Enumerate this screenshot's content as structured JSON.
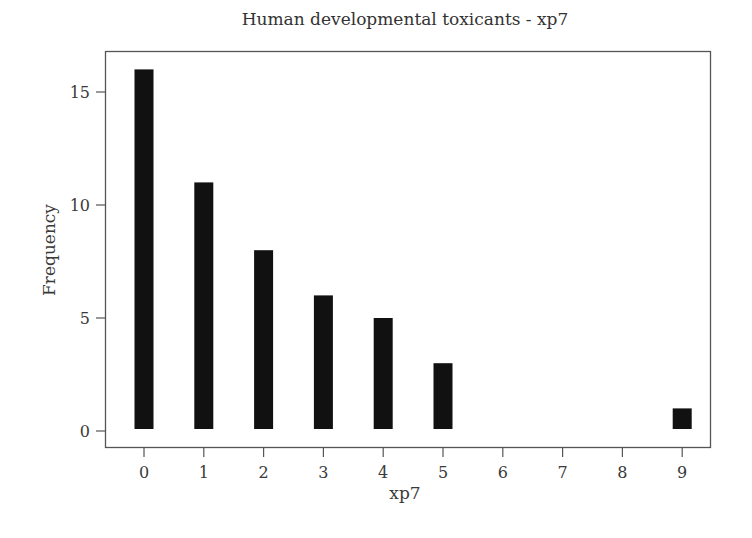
{
  "chart_data": {
    "type": "bar",
    "title": "Human developmental toxicants - xp7",
    "xlabel": "xp7",
    "ylabel": "Frequency",
    "categories": [
      "0",
      "1",
      "2",
      "3",
      "4",
      "5",
      "6",
      "7",
      "8",
      "9"
    ],
    "values": [
      16,
      11,
      8,
      6,
      5,
      3,
      0,
      0,
      0,
      1
    ],
    "x_ticks": [
      0,
      1,
      2,
      3,
      4,
      5,
      6,
      7,
      8,
      9
    ],
    "y_ticks": [
      0,
      5,
      10,
      15
    ],
    "ylim": [
      -0.7,
      16.9
    ],
    "xlim": [
      -0.65,
      9.5
    ],
    "grid": false,
    "legend": null,
    "bar_color": "#111111",
    "frame_color": "#555555"
  }
}
